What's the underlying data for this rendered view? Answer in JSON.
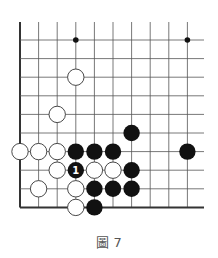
{
  "diagram": {
    "type": "go-board-fragment",
    "columns": 10,
    "rows": 10,
    "edges": [
      "left",
      "bottom"
    ],
    "colors": {
      "line": "#555555",
      "edge": "#333333",
      "black_stone": "#111111",
      "white_stone": "#ffffff",
      "white_outline": "#333333"
    },
    "star_points": [
      {
        "col": 3,
        "row": 0
      },
      {
        "col": 9,
        "row": 0
      }
    ],
    "stones": [
      {
        "color": "white",
        "col": 3,
        "row": 2
      },
      {
        "color": "white",
        "col": 2,
        "row": 4
      },
      {
        "color": "black",
        "col": 6,
        "row": 5
      },
      {
        "color": "white",
        "col": 0,
        "row": 6
      },
      {
        "color": "white",
        "col": 1,
        "row": 6
      },
      {
        "color": "white",
        "col": 2,
        "row": 6
      },
      {
        "color": "black",
        "col": 3,
        "row": 6
      },
      {
        "color": "black",
        "col": 4,
        "row": 6
      },
      {
        "color": "black",
        "col": 5,
        "row": 6
      },
      {
        "color": "black",
        "col": 9,
        "row": 6
      },
      {
        "color": "white",
        "col": 2,
        "row": 7
      },
      {
        "color": "black",
        "col": 3,
        "row": 7,
        "label": "1"
      },
      {
        "color": "white",
        "col": 4,
        "row": 7
      },
      {
        "color": "white",
        "col": 5,
        "row": 7
      },
      {
        "color": "black",
        "col": 6,
        "row": 7
      },
      {
        "color": "white",
        "col": 1,
        "row": 8
      },
      {
        "color": "white",
        "col": 3,
        "row": 8
      },
      {
        "color": "black",
        "col": 4,
        "row": 8
      },
      {
        "color": "black",
        "col": 5,
        "row": 8
      },
      {
        "color": "black",
        "col": 6,
        "row": 8
      },
      {
        "color": "white",
        "col": 3,
        "row": 9
      },
      {
        "color": "black",
        "col": 4,
        "row": 9
      }
    ]
  },
  "caption": "圖 7"
}
